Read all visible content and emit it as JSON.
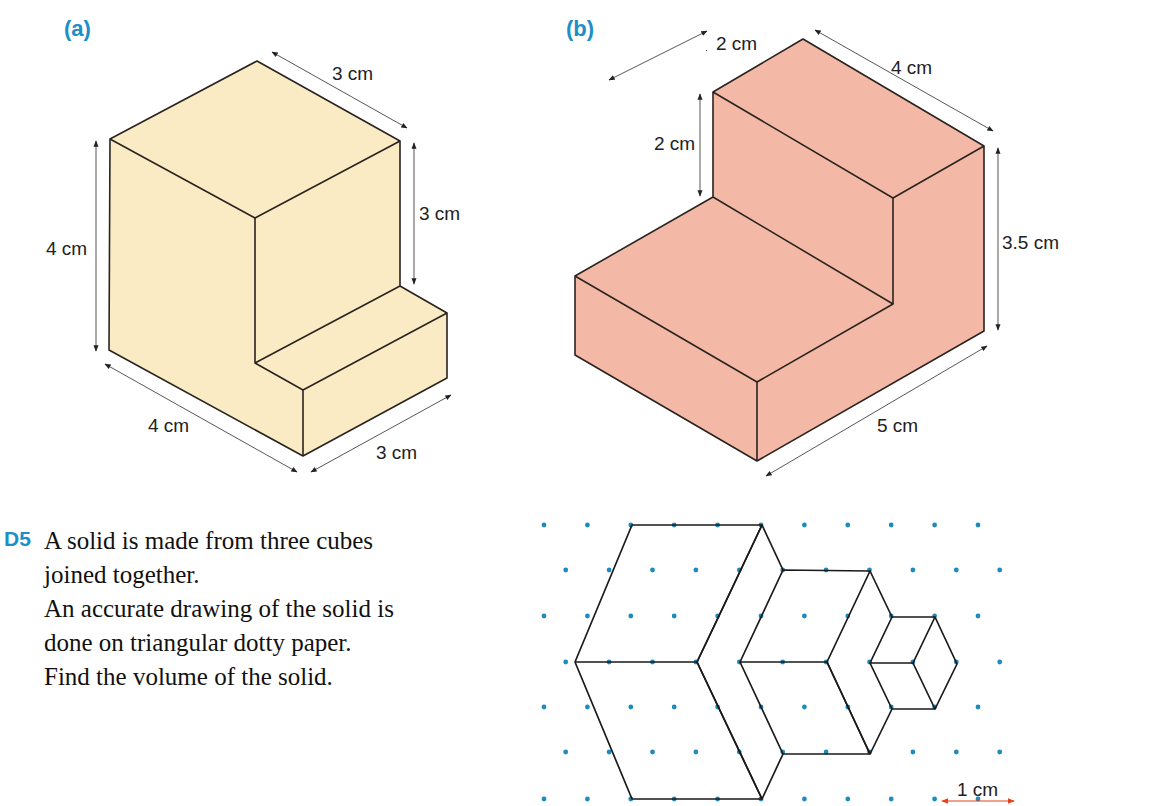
{
  "parts": [
    {
      "label": "(a)",
      "dims": {
        "top": "3 cm",
        "right": "3 cm",
        "left": "4 cm",
        "bottom_left": "4 cm",
        "bottom_right": "3 cm"
      },
      "fill": "#faebc4"
    },
    {
      "label": "(b)",
      "dims": {
        "top_left": "2 cm",
        "top_right": "4 cm",
        "left": "2 cm",
        "right": "3.5 cm",
        "bottom": "5 cm"
      },
      "fill": "#f4b9a6"
    }
  ],
  "question": {
    "number": "D5",
    "lines": [
      "A solid is made from three cubes",
      "joined together.",
      "An accurate drawing of the solid is",
      "done on triangular dotty paper.",
      "Find the volume of the solid."
    ]
  },
  "dotty": {
    "scale_label": "1 cm",
    "dot_color": "#1e8bbf",
    "arrow_color": "#e8401c"
  },
  "colors": {
    "accent": "#1c8fc6",
    "edge": "#2a2420"
  }
}
